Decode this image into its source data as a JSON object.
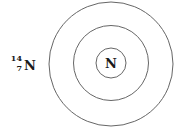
{
  "diagram": {
    "type": "bohr-model",
    "notation": {
      "mass_number": "14",
      "atomic_number": "7",
      "symbol": "N"
    },
    "nucleus_label": "N",
    "shell_count": 2,
    "colors": {
      "line": "#555555",
      "text": "#1a1a1a"
    }
  }
}
